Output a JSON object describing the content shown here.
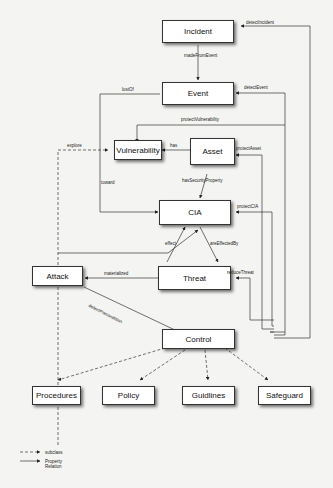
{
  "nodes": {
    "incident": "Incident",
    "event": "Event",
    "vulnerability": "Vulnerability",
    "asset": "Asset",
    "cia": "CIA",
    "attack": "Attack",
    "threat": "Threat",
    "control": "Control",
    "procedures": "Procedures",
    "policy": "Policy",
    "guidlines": "Guidlines",
    "safeguard": "Safeguard"
  },
  "relations": {
    "madeFromEvent": "madeFromEvent",
    "lostOf": "lostOf",
    "detectIncident": "detectIncident",
    "detectEvent": "detectEvent",
    "protectVulnerability": "protectVulnerability",
    "explore": "explore",
    "has": "has",
    "protectAsset": "protectAsset",
    "toward": "toward",
    "hasSecurityProperty": "hasSecurityProperty",
    "protectCIA": "protectCIA",
    "effect": "effect",
    "areEffectedBy": "areEffectedBy",
    "materialized": "materialized",
    "reduceThreat": "reduceThreat",
    "detectPrecondition": "detectPrecondition"
  },
  "legend": {
    "subclass": "subclass",
    "property_relation": "Property Relation"
  }
}
